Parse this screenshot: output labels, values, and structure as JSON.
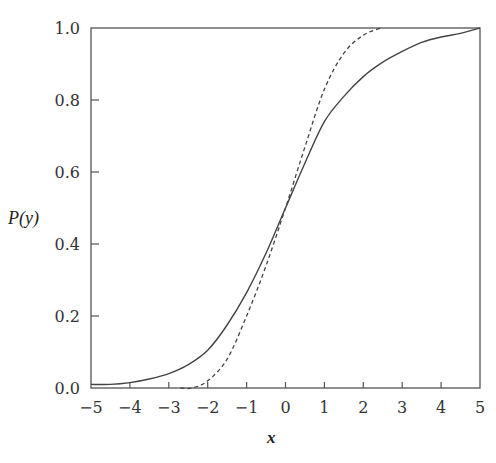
{
  "chart_data": {
    "type": "line",
    "title": "",
    "xlabel": "x",
    "ylabel": "P(y)",
    "xlim": [
      -5,
      5
    ],
    "ylim": [
      0.0,
      1.0
    ],
    "grid": false,
    "legend": null,
    "x_ticks": [
      -5,
      -4,
      -3,
      -2,
      -1,
      0,
      1,
      2,
      3,
      4,
      5
    ],
    "x_tick_labels": [
      "−5",
      "−4",
      "−3",
      "−2",
      "−1",
      "0",
      "1",
      "2",
      "3",
      "4",
      "5"
    ],
    "y_ticks": [
      0.0,
      0.2,
      0.4,
      0.6,
      0.8,
      1.0
    ],
    "y_tick_labels": [
      "0.0",
      "0.2",
      "0.4",
      "0.6",
      "0.8",
      "1.0"
    ],
    "series": [
      {
        "name": "solid",
        "style": "solid",
        "x": [
          -5,
          -4.5,
          -4,
          -3.5,
          -3,
          -2.5,
          -2,
          -1.5,
          -1,
          -0.5,
          0,
          0.5,
          1,
          1.5,
          2,
          2.5,
          3,
          3.5,
          4,
          4.5,
          5
        ],
        "values": [
          0.01,
          0.01,
          0.015,
          0.025,
          0.04,
          0.065,
          0.105,
          0.175,
          0.265,
          0.375,
          0.5,
          0.625,
          0.74,
          0.81,
          0.865,
          0.905,
          0.935,
          0.96,
          0.975,
          0.985,
          1.0
        ]
      },
      {
        "name": "dashed",
        "style": "dashed",
        "x": [
          -2.7,
          -2.4,
          -2.0,
          -1.5,
          -1.0,
          -0.5,
          0,
          0.5,
          1.0,
          1.5,
          2.0,
          2.45
        ],
        "values": [
          0.0,
          0.0,
          0.02,
          0.08,
          0.2,
          0.34,
          0.5,
          0.67,
          0.83,
          0.93,
          0.98,
          1.0
        ]
      }
    ]
  },
  "axes": {
    "x_label": "x",
    "y_label": "P(y)"
  }
}
